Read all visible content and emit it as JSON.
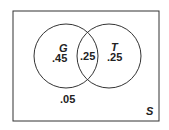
{
  "diagram": {
    "type": "venn",
    "universe": {
      "label": "S"
    },
    "sets": [
      {
        "label": "G",
        "only_value": ".45"
      },
      {
        "label": "T",
        "only_value": ".25"
      }
    ],
    "intersection_value": ".25",
    "outside_value": ".05",
    "colors": {
      "stroke": "#333333",
      "text": "#222222",
      "background": "#ffffff"
    }
  }
}
